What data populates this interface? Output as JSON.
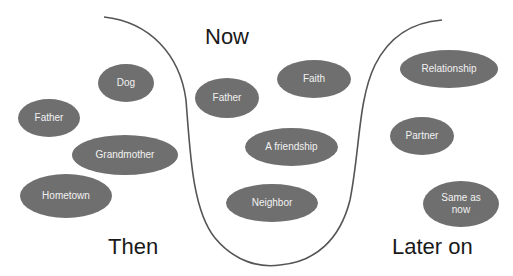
{
  "labels": {
    "now": "Now",
    "then": "Then",
    "later": "Later on"
  },
  "colors": {
    "oval_fill": "#6f6f6f",
    "oval_text": "#f2f2f2",
    "curve": "#555555"
  },
  "then_items": [
    {
      "label": "Dog"
    },
    {
      "label": "Father"
    },
    {
      "label": "Grandmother"
    },
    {
      "label": "Hometown"
    }
  ],
  "now_items": [
    {
      "label": "Father"
    },
    {
      "label": "Faith"
    },
    {
      "label": "A friendship"
    },
    {
      "label": "Neighbor"
    }
  ],
  "later_items": [
    {
      "label": "Relationship"
    },
    {
      "label": "Partner"
    },
    {
      "label": "Same as now"
    }
  ]
}
